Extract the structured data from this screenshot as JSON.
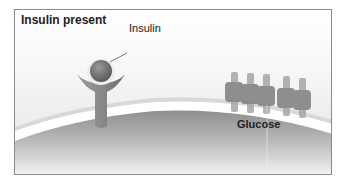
{
  "diagram": {
    "title": "Insulin present",
    "labels": {
      "insulin": "Insulin",
      "glucose": "Glucose"
    },
    "colors": {
      "border": "#8a8a8a",
      "cell_membrane": "#ffffff",
      "cell_interior": "#9a9a9a",
      "receptor": "#8c8c8c",
      "insulin_ball": "#6e6e6e",
      "transporter": "#8e8e8e"
    }
  }
}
